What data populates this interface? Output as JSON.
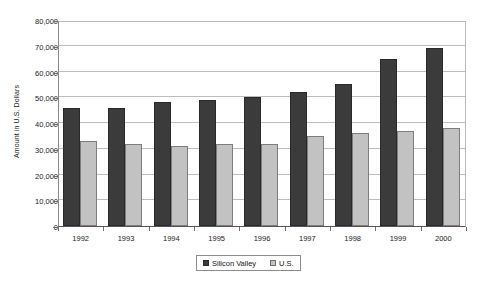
{
  "chart_data": {
    "type": "bar",
    "title": "",
    "subtitle": "",
    "xlabel": "",
    "ylabel": "Amount in U.S. Dollars",
    "categories": [
      "1992",
      "1993",
      "1994",
      "1995",
      "1996",
      "1997",
      "1998",
      "1999",
      "2000"
    ],
    "series": [
      {
        "name": "Silicon Valley",
        "color": "#3b3b3b",
        "values": [
          46000,
          46000,
          48000,
          49000,
          50000,
          52000,
          55000,
          65000,
          69000
        ]
      },
      {
        "name": "U.S.",
        "color": "#c2c2c2",
        "values": [
          33000,
          32000,
          31000,
          32000,
          32000,
          35000,
          36000,
          37000,
          38000
        ]
      }
    ],
    "ylim": [
      0,
      80000
    ],
    "ytick_values": [
      0,
      10000,
      20000,
      30000,
      40000,
      50000,
      60000,
      70000,
      80000
    ],
    "ytick_labels": [
      "0",
      "10,000",
      "20,000",
      "30,000",
      "40,000",
      "50,000",
      "60,000",
      "70,000",
      "80,000"
    ],
    "grid": true,
    "legend_position": "bottom"
  }
}
